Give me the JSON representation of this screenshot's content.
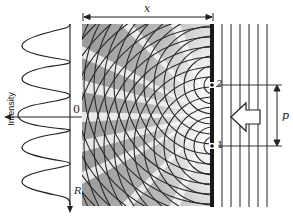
{
  "diagram": {
    "labels": {
      "intensity_axis": "Intensity",
      "origin": "0",
      "position_axis": "R",
      "distance": "x",
      "slit_top": "2",
      "slit_bottom": "1",
      "slit_separation": "p"
    },
    "colors": {
      "line": "#222222",
      "screen": "#1a1a1a",
      "pattern_light": "#f4f4f4",
      "pattern_dark": "#8a8a8a"
    },
    "geometry": {
      "pattern_box": {
        "x": 82,
        "y": 24,
        "w": 130,
        "h": 182
      },
      "slit_top_y": 85,
      "slit_bottom_y": 146,
      "screen_x": 213,
      "plane_wave_x": [
        222,
        231,
        240,
        249,
        258,
        267
      ],
      "intensity_peaks_y": [
        45,
        78,
        112,
        148,
        180
      ],
      "intensity_minima_y": [
        28,
        62,
        95,
        130,
        163,
        197
      ]
    }
  }
}
